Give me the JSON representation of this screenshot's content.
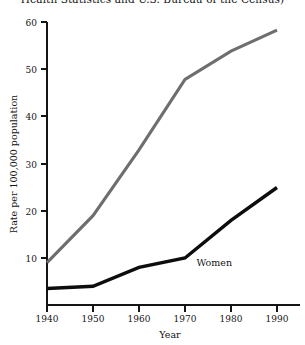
{
  "caption": {
    "fragment": "Health Statistics and U.S. Bureau of the Census)"
  },
  "chart_data": {
    "type": "line",
    "title": "",
    "xlabel": "Year",
    "ylabel": "Rate per 100,000 population",
    "x": [
      1940,
      1950,
      1960,
      1970,
      1980,
      1990
    ],
    "xticklabels": [
      "1940",
      "1950",
      "1960",
      "1970",
      "1980",
      "1990"
    ],
    "yticks": [
      10,
      20,
      30,
      40,
      50,
      60
    ],
    "yticklabels": [
      "10",
      "20",
      "30",
      "40",
      "50",
      "60"
    ],
    "xlim": [
      1940,
      1995
    ],
    "ylim": [
      0,
      62
    ],
    "grid": false,
    "legend": "inline-annotation",
    "series": [
      {
        "name": "Men",
        "label_shown": "",
        "color": "#6e6e6e",
        "values": [
          9,
          19,
          33,
          48,
          54,
          58.5
        ]
      },
      {
        "name": "Women",
        "label_shown": "Women",
        "color": "#0d0d0d",
        "values": [
          3.5,
          4,
          8,
          10,
          18,
          25
        ]
      }
    ],
    "annotations": [
      {
        "text": "Women",
        "x": 1972.5,
        "y": 8.2
      }
    ]
  },
  "axis": {
    "y_title": "Rate per 100,000 population",
    "x_title": "Year"
  }
}
